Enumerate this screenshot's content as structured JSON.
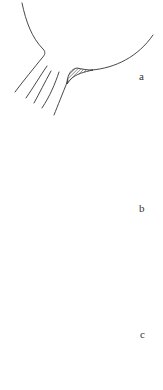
{
  "figure": {
    "panels": [
      {
        "id": "a",
        "label": "a",
        "regions": [
          {
            "name": "right-shaded-region",
            "hatch": "diagonal"
          }
        ]
      },
      {
        "id": "b",
        "label": "b",
        "regions": [
          {
            "name": "left-shaded-region",
            "hatch": "horizontal"
          },
          {
            "name": "right-shaded-region",
            "hatch": "diagonal"
          }
        ]
      },
      {
        "id": "c",
        "label": "c",
        "regions": [
          {
            "name": "left-shaded-region",
            "hatch": "horizontal"
          },
          {
            "name": "right-shaded-region",
            "hatch": "diagonal",
            "size": "large"
          }
        ]
      }
    ],
    "colors": {
      "line": "#333333",
      "background": "#ffffff"
    }
  }
}
